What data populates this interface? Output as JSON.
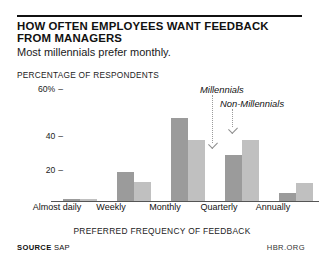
{
  "header": {
    "title": "HOW OFTEN EMPLOYEES WANT FEEDBACK FROM MANAGERS",
    "subtitle": "Most millennials prefer monthly."
  },
  "footer": {
    "source_label": "SOURCE",
    "source_value": "SAP",
    "brand": "HBR.ORG"
  },
  "annotations": {
    "millennials": "Millennials",
    "non_millennials": "Non-Millennials"
  },
  "colors": {
    "millennials_bar": "#9b9b9b",
    "non_millennials_bar": "#c0c0c0",
    "rule": "#111111",
    "axis": "#555555"
  },
  "chart_data": {
    "type": "bar",
    "title": "HOW OFTEN EMPLOYEES WANT FEEDBACK FROM MANAGERS",
    "subtitle": "Most millennials prefer monthly.",
    "xlabel": "PREFERRED FREQUENCY OF FEEDBACK",
    "ylabel": "PERCENTAGE OF RESPONDENTS",
    "ylim": [
      0,
      60
    ],
    "yticks": [
      20,
      40,
      60
    ],
    "ytick_labels": [
      "20",
      "40",
      "60%"
    ],
    "grid": false,
    "legend_position": "inline-annotation",
    "categories": [
      "Almost daily",
      "Weekly",
      "Monthly",
      "Quarterly",
      "Annually"
    ],
    "series": [
      {
        "name": "Millennials",
        "values": [
          1,
          18,
          52,
          29,
          5
        ]
      },
      {
        "name": "Non-Millennials",
        "values": [
          1,
          12,
          38,
          38,
          11
        ]
      }
    ],
    "annotations": [
      {
        "text": "Millennials",
        "points_to": "Quarterly / Millennials bar"
      },
      {
        "text": "Non-Millennials",
        "points_to": "Quarterly / Non-Millennials bar"
      }
    ]
  }
}
